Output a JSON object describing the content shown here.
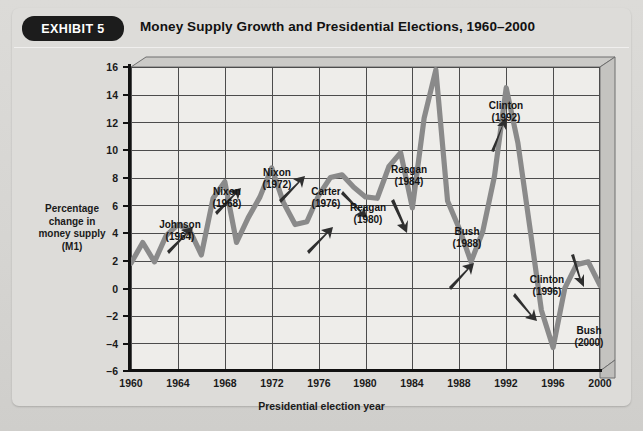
{
  "exhibit": {
    "badge": "EXHIBIT 5",
    "title": "Money Supply Growth and Presidential Elections, 1960–2000"
  },
  "chart_data": {
    "type": "line",
    "title": "Money Supply Growth and Presidential Elections, 1960–2000",
    "xlabel": "Presidential election year",
    "ylabel": "Percentage change in money supply (M1)",
    "ylabel_lines": [
      "Percentage",
      "change in",
      "money supply",
      "(M1)"
    ],
    "xlim": [
      1960,
      2000
    ],
    "ylim": [
      -6,
      16
    ],
    "xticks": [
      1960,
      1964,
      1968,
      1972,
      1976,
      1980,
      1984,
      1988,
      1992,
      1996,
      2000
    ],
    "yticks": [
      -6,
      -4,
      -2,
      0,
      2,
      4,
      6,
      8,
      10,
      12,
      14,
      16
    ],
    "grid": true,
    "legend": "none",
    "line_color": "#8a8a8a",
    "series": [
      {
        "name": "Percentage change in money supply (M1)",
        "x": [
          1960,
          1961,
          1962,
          1963,
          1964,
          1965,
          1966,
          1967,
          1968,
          1969,
          1970,
          1971,
          1972,
          1973,
          1974,
          1975,
          1976,
          1977,
          1978,
          1979,
          1980,
          1981,
          1982,
          1983,
          1984,
          1985,
          1986,
          1987,
          1988,
          1989,
          1990,
          1991,
          1992,
          1993,
          1994,
          1995,
          1996,
          1997,
          1998,
          1999,
          2000
        ],
        "values": [
          1.8,
          3.3,
          1.9,
          3.8,
          4.6,
          4.2,
          2.4,
          6.5,
          7.7,
          3.3,
          5.1,
          6.6,
          8.7,
          6.2,
          4.6,
          4.8,
          6.7,
          8.0,
          8.2,
          7.3,
          6.6,
          6.5,
          8.8,
          9.8,
          5.8,
          12.3,
          15.8,
          6.3,
          4.3,
          1.9,
          4.1,
          8.1,
          14.5,
          10.5,
          4.5,
          -1.6,
          -4.3,
          0.0,
          1.7,
          1.9,
          0.2
        ]
      }
    ],
    "annotations": [
      {
        "label": "Johnson",
        "year": "(1964)",
        "direction": "up"
      },
      {
        "label": "Nixon",
        "year": "(1968)",
        "direction": "up"
      },
      {
        "label": "Nixon",
        "year": "(1972)",
        "direction": "up"
      },
      {
        "label": "Carter",
        "year": "(1976)",
        "direction": "up"
      },
      {
        "label": "Reagan",
        "year": "(1980)",
        "direction": "down"
      },
      {
        "label": "Reagan",
        "year": "(1984)",
        "direction": "down"
      },
      {
        "label": "Bush",
        "year": "(1988)",
        "direction": "up"
      },
      {
        "label": "Clinton",
        "year": "(1992)",
        "direction": "up"
      },
      {
        "label": "Clinton",
        "year": "(1996)",
        "direction": "down"
      },
      {
        "label": "Bush",
        "year": "(2000)",
        "direction": "down"
      }
    ]
  },
  "ytick_labels": {
    "t16": "16",
    "t14": "14",
    "t12": "12",
    "t10": "10",
    "t8": "8",
    "t6": "6",
    "t4": "4",
    "t2": "2",
    "t0": "0",
    "tm2": "–2",
    "tm4": "–4",
    "tm6": "–6"
  },
  "xtick_labels": {
    "x1960": "1960",
    "x1964": "1964",
    "x1968": "1968",
    "x1972": "1972",
    "x1976": "1976",
    "x1980": "1980",
    "x1984": "1984",
    "x1988": "1988",
    "x1992": "1992",
    "x1996": "1996",
    "x2000": "2000"
  },
  "axis_titles": {
    "x": "Presidential election year",
    "y_line1": "Percentage",
    "y_line2": "change in",
    "y_line3": "money supply",
    "y_line4": "(M1)"
  },
  "annot_text": {
    "a1_name": "Johnson",
    "a1_year": "(1964)",
    "a2_name": "Nixon",
    "a2_year": "(1968)",
    "a3_name": "Nixon",
    "a3_year": "(1972)",
    "a4_name": "Carter",
    "a4_year": "(1976)",
    "a5_name": "Reagan",
    "a5_year": "(1980)",
    "a6_name": "Reagan",
    "a6_year": "(1984)",
    "a7_name": "Bush",
    "a7_year": "(1988)",
    "a8_name": "Clinton",
    "a8_year": "(1992)",
    "a9_name": "Clinton",
    "a9_year": "(1996)",
    "a10_name": "Bush",
    "a10_year": "(2000)"
  },
  "colors": {
    "background": "#d8d7d4",
    "panel": "#dddcd9",
    "plot_surface": "#eeedea",
    "badge_bg": "#1c1c1c",
    "badge_text": "#ffffff",
    "line": "#8a8a8a",
    "grid": "#4c4c4c",
    "axis": "#111111",
    "arrow": "#2a2a2a"
  }
}
